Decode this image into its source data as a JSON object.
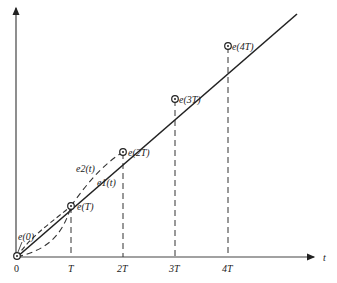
{
  "diagram": {
    "axes": {
      "x_label": "t",
      "origin_label": "0",
      "x_ticks": [
        "T",
        "2T",
        "3T",
        "4T"
      ]
    },
    "points": [
      {
        "label": "e(0)"
      },
      {
        "label": "e(T)"
      },
      {
        "label": "e(2T)"
      },
      {
        "label": "e(3T)"
      },
      {
        "label": "e(4T)"
      }
    ],
    "curves": {
      "e1": "e1(t)",
      "e2": "e2(t)"
    },
    "colors": {
      "ink": "#222222",
      "background": "#ffffff"
    }
  }
}
